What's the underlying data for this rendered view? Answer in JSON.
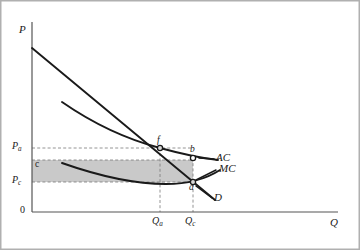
{
  "figure": {
    "background_color": "#ffffff",
    "frame_color": "#b0b0b0",
    "line_color": "#1a1a1a",
    "axis_color": "#555555",
    "dash_color": "#808080",
    "shade_color": "#c9c9c9"
  },
  "axes": {
    "y_label": "P",
    "x_label": "Q",
    "origin_label": "0"
  },
  "price_ticks": [
    {
      "id": "Pa",
      "label": "P",
      "sub": "a",
      "y_value": 148
    },
    {
      "id": "Pc",
      "label": "P",
      "sub": "c",
      "y_value": 182
    }
  ],
  "quantity_ticks": [
    {
      "id": "Qa",
      "label": "Q",
      "sub": "a",
      "x_value": 160
    },
    {
      "id": "Qc",
      "label": "Q",
      "sub": "c",
      "x_value": 193
    }
  ],
  "cost_levels": [
    {
      "id": "c",
      "label": "c",
      "y_value": 160
    }
  ],
  "curves": [
    {
      "id": "AC",
      "label": "AC",
      "description": "average cost curve, downward sloping then flattening"
    },
    {
      "id": "MC",
      "label": "MC",
      "description": "marginal cost curve, U-shaped shallow, below AC"
    },
    {
      "id": "D",
      "label": "D",
      "description": "demand curve, straight downward sloping line"
    }
  ],
  "points": [
    {
      "id": "f",
      "label": "f",
      "marker": "filled",
      "x": 160,
      "y": 148,
      "description": "demand meets average cost at Qa, Pa"
    },
    {
      "id": "b",
      "label": "b",
      "marker": "open",
      "x": 193,
      "y": 158,
      "description": "average cost at competitive quantity Qc"
    },
    {
      "id": "a",
      "label": "a",
      "marker": "filled",
      "x": 193,
      "y": 182,
      "description": "marginal cost meets demand at Qc, Pc"
    }
  ],
  "shaded_region": {
    "label": "c",
    "description": "rectangle of losses between cost level c and price Pc up to Qc",
    "x_start": 32,
    "x_end": 193,
    "y_top": 160,
    "y_bottom": 182
  },
  "chart_data": {
    "type": "line",
    "title": "",
    "xlabel": "Q",
    "ylabel": "P",
    "grid": false,
    "legend": "inline-right",
    "xlim": [
      0,
      330
    ],
    "ylim": [
      0,
      215
    ],
    "series": [
      {
        "name": "D",
        "type": "line",
        "points": [
          [
            32,
            48
          ],
          [
            215,
            200
          ]
        ]
      },
      {
        "name": "AC",
        "type": "curve",
        "points": [
          [
            62,
            102
          ],
          [
            100,
            124
          ],
          [
            130,
            138
          ],
          [
            160,
            148
          ],
          [
            193,
            158
          ],
          [
            215,
            161
          ]
        ]
      },
      {
        "name": "MC",
        "type": "curve",
        "points": [
          [
            62,
            163
          ],
          [
            100,
            174
          ],
          [
            140,
            182
          ],
          [
            160,
            184
          ],
          [
            193,
            182
          ],
          [
            218,
            172
          ]
        ]
      }
    ],
    "annotations": [
      {
        "text": "Pa",
        "type": "y-tick",
        "value": 148
      },
      {
        "text": "Pc",
        "type": "y-tick",
        "value": 182
      },
      {
        "text": "c",
        "type": "y-tick",
        "value": 160
      },
      {
        "text": "Qa",
        "type": "x-tick",
        "value": 160
      },
      {
        "text": "Qc",
        "type": "x-tick",
        "value": 193
      },
      {
        "text": "f",
        "type": "point",
        "value": [
          160,
          148
        ]
      },
      {
        "text": "b",
        "type": "point",
        "value": [
          193,
          158
        ]
      },
      {
        "text": "a",
        "type": "point",
        "value": [
          193,
          182
        ]
      }
    ]
  }
}
